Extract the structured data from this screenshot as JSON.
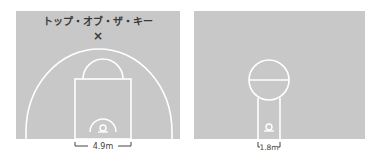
{
  "diagrams": [
    {
      "id": "modern-court",
      "annotation_label": "トップ・オブ・ザ・キー",
      "marker_glyph": "×",
      "dimension_label": "4.9m"
    },
    {
      "id": "old-court",
      "dimension_label": "1.8m"
    }
  ],
  "colors": {
    "court": "#c8c8c8",
    "lines": "#ffffff",
    "text": "#3a3a3a",
    "background": "#ffffff"
  }
}
